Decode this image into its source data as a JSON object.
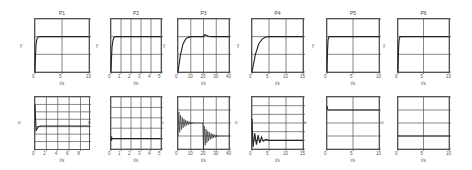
{
  "chart_data": [
    {
      "type": "line",
      "title": "P1",
      "xlabel": "t/s",
      "ylabel": "y",
      "xlim": [
        0,
        10
      ],
      "ylim": [
        0,
        1.5
      ],
      "xticks": [
        "0",
        "5",
        "10"
      ],
      "yticks": [
        "0",
        "0.5",
        "1",
        "1.5"
      ],
      "grid": true,
      "series": [
        {
          "name": "y",
          "x": [
            0,
            0.1,
            0.2,
            0.4,
            0.6,
            1,
            2,
            10
          ],
          "values": [
            0,
            0.5,
            0.8,
            0.95,
            0.99,
            1,
            1,
            1
          ]
        }
      ]
    },
    {
      "type": "line",
      "title": "P2",
      "xlabel": "t/s",
      "ylabel": "y",
      "xlim": [
        0,
        5
      ],
      "ylim": [
        0,
        1.5
      ],
      "xticks": [
        "0",
        "1",
        "2",
        "3",
        "4",
        "5"
      ],
      "yticks": [
        "0",
        "0.5",
        "1",
        "1.5"
      ],
      "grid": true,
      "series": [
        {
          "name": "y",
          "x": [
            0,
            0.05,
            0.1,
            0.2,
            0.3,
            0.4,
            5
          ],
          "values": [
            0,
            0.4,
            0.7,
            0.9,
            0.98,
            1,
            1
          ]
        }
      ]
    },
    {
      "type": "line",
      "title": "P3",
      "xlabel": "t/s",
      "ylabel": "y",
      "xlim": [
        0,
        40
      ],
      "ylim": [
        0,
        1.5
      ],
      "xticks": [
        "0",
        "10",
        "20",
        "30",
        "40"
      ],
      "yticks": [
        "0",
        "0.5",
        "1",
        "1.5"
      ],
      "grid": true,
      "series": [
        {
          "name": "y",
          "x": [
            0,
            2,
            4,
            6,
            8,
            10,
            20,
            21,
            22,
            24,
            26,
            40
          ],
          "values": [
            0,
            0.5,
            0.8,
            0.93,
            0.98,
            1,
            1,
            1.06,
            1.04,
            1.01,
            1,
            1
          ]
        }
      ]
    },
    {
      "type": "line",
      "title": "P4",
      "xlabel": "t/s",
      "ylabel": "y",
      "xlim": [
        0,
        15
      ],
      "ylim": [
        0,
        1.5
      ],
      "xticks": [
        "0",
        "5",
        "10",
        "15"
      ],
      "yticks": [
        "0",
        "0.5",
        "1",
        "1.5"
      ],
      "grid": true,
      "series": [
        {
          "name": "y",
          "x": [
            0,
            1,
            2,
            3,
            4,
            5,
            15
          ],
          "values": [
            0,
            0.5,
            0.8,
            0.93,
            0.99,
            1,
            1
          ]
        }
      ]
    },
    {
      "type": "line",
      "title": "P5",
      "xlabel": "t/s",
      "ylabel": "y",
      "xlim": [
        0,
        10
      ],
      "ylim": [
        0,
        1.5
      ],
      "xticks": [
        "0",
        "5",
        "10"
      ],
      "yticks": [
        "0",
        "0.5",
        "1",
        "1.5"
      ],
      "grid": true,
      "series": [
        {
          "name": "y",
          "x": [
            0,
            0.1,
            0.2,
            0.4,
            10
          ],
          "values": [
            0,
            0.6,
            0.9,
            1,
            1
          ]
        }
      ]
    },
    {
      "type": "line",
      "title": "P6",
      "xlabel": "t/s",
      "ylabel": "y",
      "xlim": [
        0,
        10
      ],
      "ylim": [
        0,
        1.5
      ],
      "xticks": [
        "0",
        "5",
        "10"
      ],
      "yticks": [
        "0",
        "0.5",
        "1",
        "1.5"
      ],
      "grid": true,
      "series": [
        {
          "name": "y",
          "x": [
            0,
            0.1,
            0.2,
            0.4,
            10
          ],
          "values": [
            0,
            0.6,
            0.9,
            1,
            1
          ]
        }
      ]
    },
    {
      "type": "line",
      "title": "",
      "xlabel": "t/s",
      "ylabel": "u",
      "xlim": [
        0,
        9.5
      ],
      "ylim": [
        -60,
        80
      ],
      "xticks": [
        "0",
        "2",
        "4",
        "6",
        "8"
      ],
      "yticks": [
        "-40",
        "-20",
        "0",
        "20",
        "40",
        "60",
        "80"
      ],
      "grid": true,
      "series": [
        {
          "name": "u",
          "x": [
            0,
            0.1,
            0.2,
            0.4,
            0.6,
            1,
            2,
            9.5
          ],
          "values": [
            60,
            20,
            -10,
            -5,
            0,
            2,
            2,
            2
          ]
        }
      ]
    },
    {
      "type": "line",
      "title": "",
      "xlabel": "t/s",
      "ylabel": "u",
      "xlim": [
        0,
        5
      ],
      "ylim": [
        -2000,
        8000
      ],
      "xticks": [
        "0",
        "1",
        "2",
        "3",
        "4",
        "5"
      ],
      "yticks": [
        "-2000",
        "0",
        "2000",
        "4000",
        "6000",
        "8000"
      ],
      "grid": true,
      "series": [
        {
          "name": "u",
          "x": [
            0,
            0.05,
            0.1,
            0.2,
            0.4,
            5
          ],
          "values": [
            500,
            -400,
            100,
            0,
            0,
            0
          ]
        }
      ]
    },
    {
      "type": "line",
      "title": "",
      "xlabel": "t/s",
      "ylabel": "u",
      "xlim": [
        0,
        40
      ],
      "ylim": [
        -2,
        2
      ],
      "xticks": [
        "0",
        "10",
        "20",
        "30",
        "40"
      ],
      "yticks": [
        "-2",
        "-1",
        "0",
        "1",
        "2"
      ],
      "grid": true,
      "series": [
        {
          "name": "u",
          "envelope": true,
          "x": [
            0,
            10,
            20,
            20.01,
            30,
            40
          ],
          "upper": [
            1,
            0.1,
            0,
            -0.1,
            -1,
            -1
          ],
          "lower": [
            -1,
            -0.1,
            0,
            -2,
            -1.1,
            -1
          ]
        }
      ]
    },
    {
      "type": "line",
      "title": "",
      "xlabel": "t/s",
      "ylabel": "u",
      "xlim": [
        0,
        15
      ],
      "ylim": [
        -10,
        50
      ],
      "xticks": [
        "0",
        "5",
        "10",
        "15"
      ],
      "yticks": [
        "-10",
        "0",
        "10",
        "20",
        "30",
        "40",
        "50"
      ],
      "grid": true,
      "series": [
        {
          "name": "u",
          "x": [
            0,
            0.3,
            0.8,
            1.3,
            1.8,
            2.3,
            2.8,
            3.3,
            4,
            5,
            7,
            15
          ],
          "values": [
            25,
            -8,
            8,
            -5,
            6,
            -3,
            4,
            -1,
            1,
            0,
            0,
            0
          ]
        }
      ]
    },
    {
      "type": "line",
      "title": "",
      "xlabel": "t/s",
      "ylabel": "u",
      "xlim": [
        0,
        10
      ],
      "ylim": [
        -600,
        200
      ],
      "xticks": [
        "0",
        "5",
        "10"
      ],
      "yticks": [
        "-600",
        "-400",
        "-200",
        "0",
        "200"
      ],
      "grid": true,
      "series": [
        {
          "name": "u",
          "x": [
            0,
            0.1,
            0.2,
            0.4,
            10
          ],
          "values": [
            60,
            20,
            0,
            0,
            0
          ]
        }
      ]
    },
    {
      "type": "line",
      "title": "",
      "xlabel": "t/s",
      "ylabel": "u",
      "xlim": [
        0,
        10
      ],
      "ylim": [
        -100,
        300
      ],
      "xticks": [
        "0",
        "5",
        "10"
      ],
      "yticks": [
        "-100",
        "0",
        "100",
        "200",
        "300"
      ],
      "grid": true,
      "series": [
        {
          "name": "u",
          "x": [
            0,
            0.1,
            0.2,
            10
          ],
          "values": [
            5,
            0,
            0,
            0
          ]
        }
      ]
    }
  ]
}
